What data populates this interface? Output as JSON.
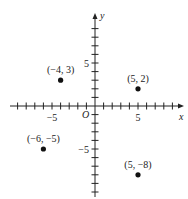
{
  "chart_data": {
    "type": "scatter",
    "title": "",
    "xlabel": "x",
    "ylabel": "y",
    "origin_label": "O",
    "xlim": [
      -10,
      10
    ],
    "ylim": [
      -10,
      10
    ],
    "x_tick_step": 1,
    "y_tick_step": 1,
    "x_tick_labels": [
      {
        "value": -5,
        "text": "−5"
      },
      {
        "value": 5,
        "text": "5"
      }
    ],
    "y_tick_labels": [
      {
        "value": 5,
        "text": "5"
      },
      {
        "value": -5,
        "text": "−5"
      }
    ],
    "grid": false,
    "legend": null,
    "points": [
      {
        "x": -4,
        "y": 3,
        "label": "(−4, 3)"
      },
      {
        "x": 5,
        "y": 2,
        "label": "(5, 2)"
      },
      {
        "x": -6,
        "y": -5,
        "label": "(−6, −5)"
      },
      {
        "x": 5,
        "y": -8,
        "label": "(5, −8)"
      }
    ],
    "colors": {
      "axis": "#222222",
      "point": "#111111",
      "text": "#222222"
    }
  }
}
